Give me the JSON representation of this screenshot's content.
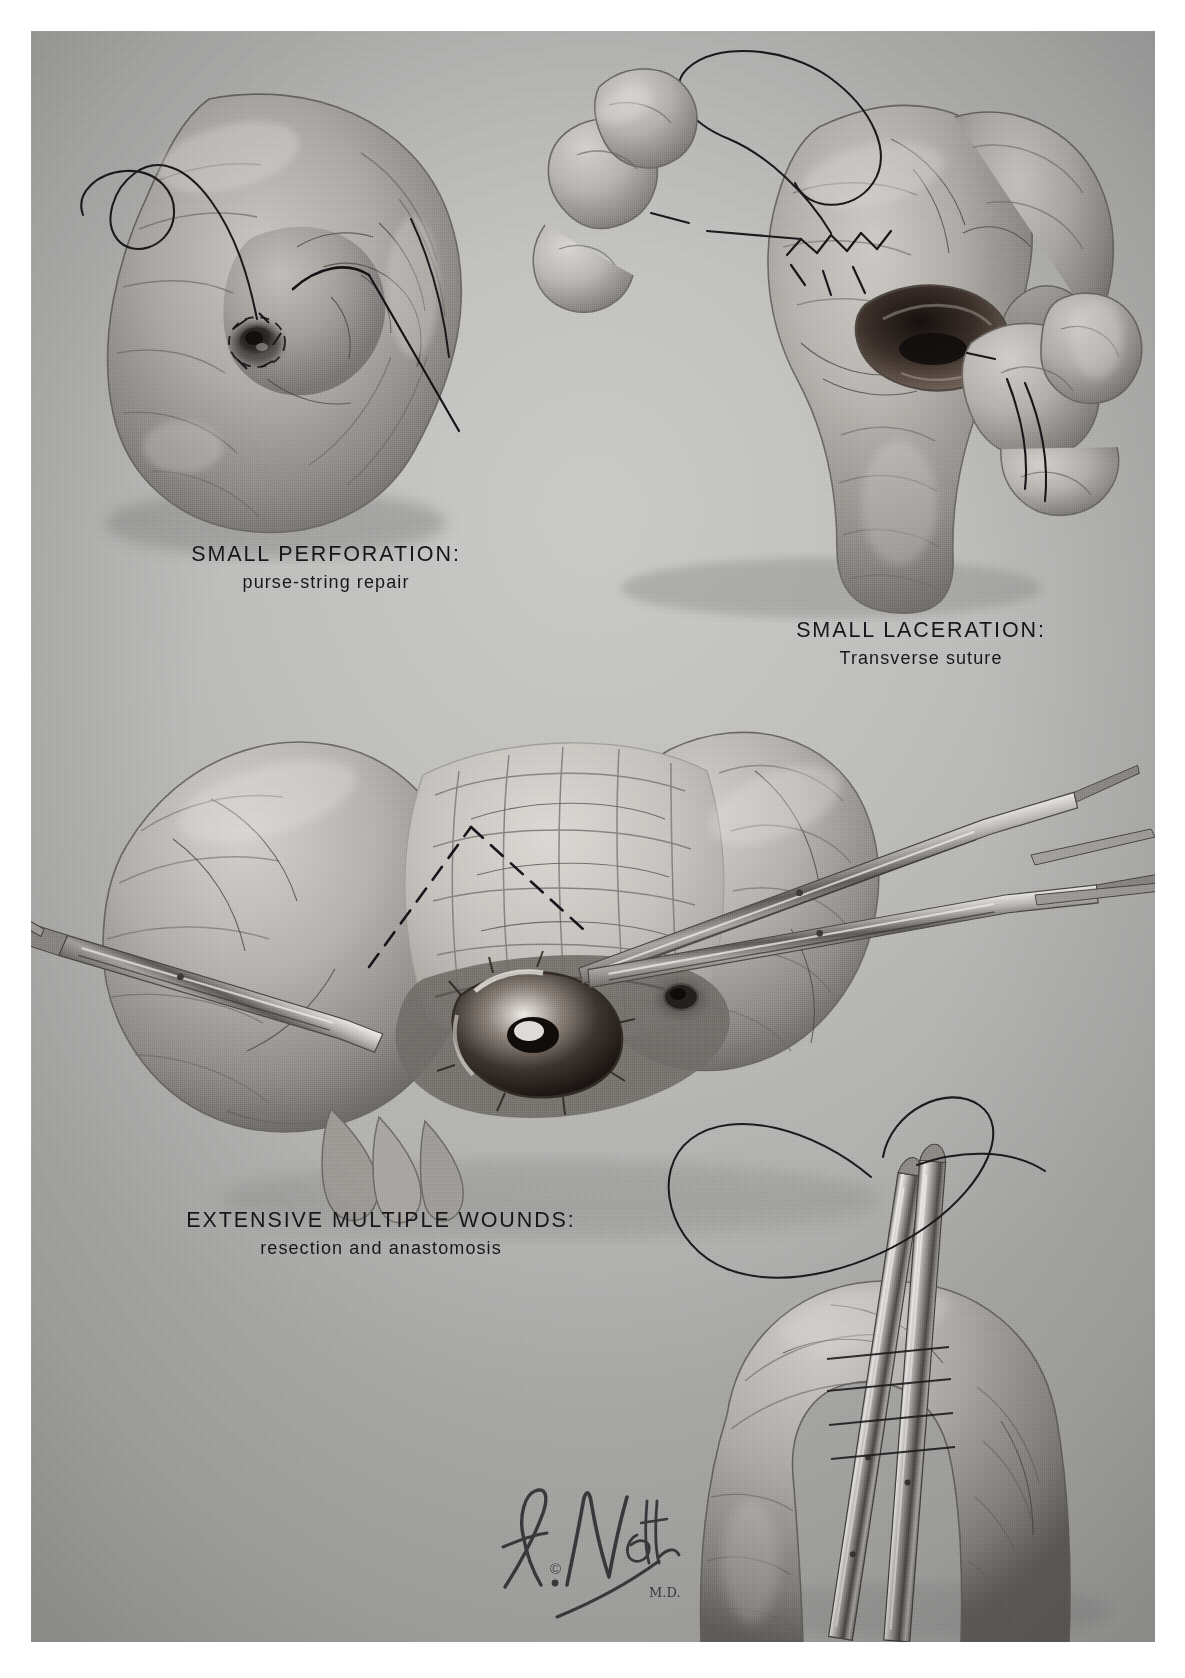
{
  "plate": {
    "medium": "grayscale halftone medical illustration",
    "background_color": "#bdbdbb",
    "ink_color": "#16161a"
  },
  "figures": [
    {
      "id": "small-perforation",
      "caption_title": "SMALL PERFORATION:",
      "caption_subtitle": "purse-string repair",
      "depicts": "loop of small intestine with a small round perforation encircled by a purse-string suture, curved needle and long suture thread trailing to the upper left"
    },
    {
      "id": "small-laceration",
      "caption_title": "SMALL LACERATION:",
      "caption_subtitle": "Transverse suture",
      "depicts": "surgeon's gloved fingers steadying a bowel loop with an open longitudinal laceration being closed transversely by interrupted sutures; needle holder at right"
    },
    {
      "id": "extensive-multiple-wounds",
      "caption_title": "EXTENSIVE MULTIPLE WOUNDS:",
      "caption_subtitle": "resection and anastomosis",
      "depicts": "devascularized segment of small bowel with a large ragged blast wound and satellite perforations; hemostats/clamps grasp the mesentery and the dashed line marks the planned V-shaped wedge line of mesenteric division for resection"
    },
    {
      "id": "anastomosis-inset",
      "caption_title": "",
      "caption_subtitle": "",
      "depicts": "lower-right inset: bowel loop occluded by two parallel non-crushing intestinal clamps with suture thread looping above"
    }
  ],
  "signature": {
    "artist": "F. Netter",
    "credential": "M.D.",
    "copyright_mark": "©"
  }
}
